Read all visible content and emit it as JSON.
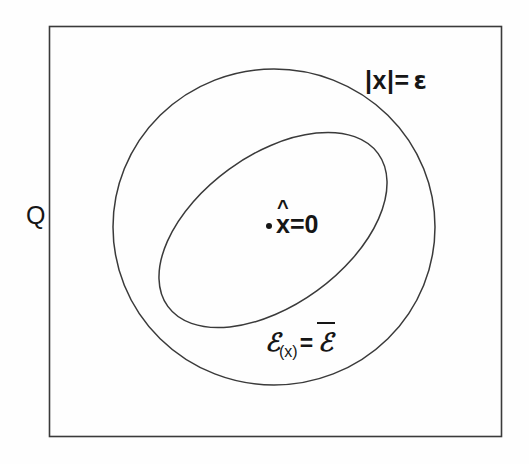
{
  "figure": {
    "background_color": "#fefefe",
    "stroke_color": "#2b2b2b",
    "text_color": "#161616",
    "universe": {
      "name": "outer-rectangle",
      "label": "Q",
      "x": 49,
      "y": 26,
      "width": 453,
      "height": 411
    },
    "outer_ellipse": {
      "name": "epsilon-ball",
      "label_prefix": "|x|=",
      "label_symbol": "ε",
      "cx": 274,
      "cy": 227,
      "rx": 161,
      "ry": 158,
      "rotation_deg": 0
    },
    "inner_ellipse": {
      "name": "set-E",
      "label_main": "ℰ",
      "label_subscript": "(x)",
      "label_equals": "=",
      "label_rhs": "ℰ",
      "label_rhs_has_overbar": true,
      "cx": 273,
      "cy": 230,
      "rx": 130,
      "ry": 75,
      "rotation_deg": -36
    },
    "center_point": {
      "name": "origin-point",
      "marker": "•",
      "variable": "x",
      "accent": "^",
      "equals_value": "=0",
      "x": 272,
      "y": 228
    }
  }
}
